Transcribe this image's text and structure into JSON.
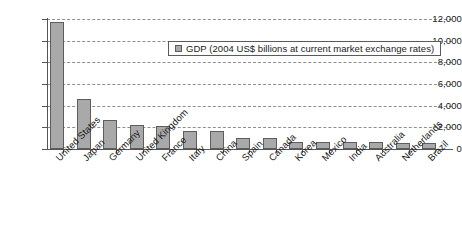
{
  "chart_data": {
    "type": "bar",
    "title": "",
    "xlabel": "",
    "ylabel": "",
    "ylim": [
      0,
      12000
    ],
    "ytick_step": 2000,
    "grid": true,
    "legend_position": "upper-right-inside",
    "categories": [
      "United States",
      "Japan",
      "Germany",
      "United Kingdom",
      "France",
      "Italy",
      "China",
      "Spain",
      "Canada",
      "Korea",
      "Mexico",
      "India",
      "Australia",
      "Netherlands",
      "Brazil"
    ],
    "values": [
      11700,
      4600,
      2700,
      2200,
      2100,
      1700,
      1650,
      1050,
      980,
      680,
      680,
      690,
      640,
      580,
      600
    ],
    "ytick_labels": [
      "0",
      "2,000",
      "4,000",
      "6,000",
      "8,000",
      "10,000",
      "12,000"
    ],
    "series": [
      {
        "name": "GDP (2004 US$ billions at current market exchange rates)",
        "color": "#a9a9a9",
        "border_color": "#5d5d5d",
        "values": [
          11700,
          4600,
          2700,
          2200,
          2100,
          1700,
          1650,
          1050,
          980,
          680,
          680,
          690,
          640,
          580,
          600
        ]
      }
    ]
  },
  "legend": {
    "entries": [
      {
        "label": "GDP (2004 US$ billions at current market exchange rates)",
        "swatch_color": "#a9a9a9"
      }
    ]
  },
  "axes": {
    "y_min_label": "0",
    "y_max_label": "12,000"
  },
  "colors": {
    "bar_fill": "#a9a9a9",
    "bar_border": "#5d5d5d",
    "grid": "#8f8f8f",
    "axis": "#555555",
    "text": "#1a1a1a",
    "background": "#ffffff"
  }
}
